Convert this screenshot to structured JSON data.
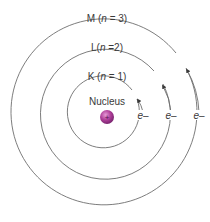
{
  "diagram": {
    "type": "bohr-atom-model",
    "nucleus": {
      "label": "Nucleus",
      "charge_symbol": "+",
      "color": "#b0409a"
    },
    "shells": [
      {
        "name": "K",
        "n_label": "n",
        "n_value": "1",
        "label_prefix": "K (",
        "label_eq": " = 1)",
        "electron_label": "e–"
      },
      {
        "name": "L",
        "n_label": "n",
        "n_value": "2",
        "label_prefix": "L(",
        "label_eq": " =2)",
        "electron_label": "e–"
      },
      {
        "name": "M",
        "n_label": "n",
        "n_value": "3",
        "label_prefix": "M (",
        "label_eq": " = 3)",
        "electron_label": "e–"
      }
    ],
    "colors": {
      "orbit": "#6e6e6e",
      "text": "#3a3a3a",
      "background": "#ffffff"
    }
  }
}
